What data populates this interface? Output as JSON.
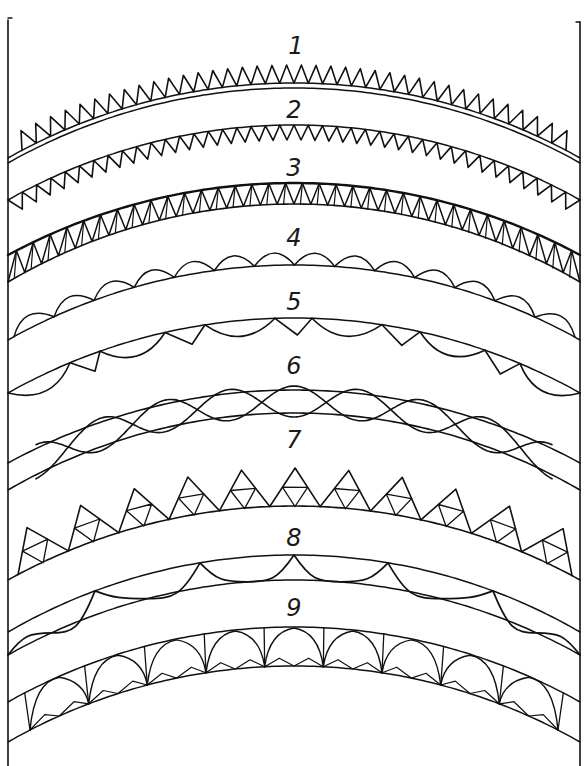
{
  "figure": {
    "ink_color": "#111111",
    "background": "#ffffff",
    "frame": {
      "left_x": 8,
      "right_x": 580,
      "top_y": 18,
      "bottom_y": 766
    },
    "center_x": 294
  },
  "bands": [
    {
      "id": 1,
      "label": "1",
      "label_xy": [
        296,
        56
      ],
      "style": "zigzag-up-double-base",
      "outer": {
        "cy": 83,
        "ey": 158
      },
      "inner": {
        "cy": 88,
        "ey": 163
      },
      "tooth_height": 18,
      "teeth": 38
    },
    {
      "id": 2,
      "label": "2",
      "label_xy": [
        294,
        120
      ],
      "style": "zigzag-down",
      "outer": {
        "cy": 125,
        "ey": 200
      },
      "tooth_height": 15,
      "teeth": 40
    },
    {
      "id": 3,
      "label": "3",
      "label_xy": [
        294,
        178
      ],
      "style": "triangle-band",
      "outer": {
        "cy": 183,
        "ey": 255
      },
      "inner": {
        "cy": 204,
        "ey": 282
      },
      "teeth": 34
    },
    {
      "id": 4,
      "label": "4",
      "label_xy": [
        294,
        248
      ],
      "style": "scallops-up",
      "outer": {
        "cy": 265,
        "ey": 340
      },
      "bump_height": 13,
      "bumps": 14
    },
    {
      "id": 5,
      "label": "5",
      "label_xy": [
        294,
        312
      ],
      "style": "scallops-and-vs-down",
      "outer": {
        "cy": 318,
        "ey": 393
      },
      "bump_height": 17,
      "bumps": 10
    },
    {
      "id": 6,
      "label": "6",
      "label_xy": [
        294,
        376
      ],
      "style": "interlaced-waves",
      "outer": {
        "cy": 390,
        "ey": 463
      },
      "inner": {
        "cy": 413,
        "ey": 490
      },
      "waves": 4
    },
    {
      "id": 7,
      "label": "7",
      "label_xy": [
        294,
        450
      ],
      "style": "subdivided-triangles",
      "outer": {
        "cy": 506,
        "ey": 580
      },
      "tooth_height": 38,
      "teeth": 11
    },
    {
      "id": 8,
      "label": "8",
      "label_xy": [
        294,
        548
      ],
      "style": "wavy-between",
      "outer": {
        "cy": 555,
        "ey": 632
      },
      "inner": {
        "cy": 580,
        "ey": 655
      },
      "waves": 5
    },
    {
      "id": 9,
      "label": "9",
      "label_xy": [
        294,
        618
      ],
      "style": "gothic-arches",
      "outer": {
        "cy": 627,
        "ey": 702
      },
      "inner": {
        "cy": 666,
        "ey": 742
      },
      "arches": 9
    }
  ]
}
